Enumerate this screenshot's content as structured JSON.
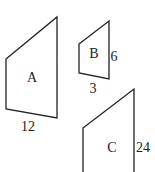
{
  "diagram": {
    "shapes": [
      {
        "id": "A",
        "label": "A",
        "dimension_label": "12",
        "dimension_side": "bottom",
        "points": "6,59 57,17 57,118 6,109",
        "label_pos": [
          32,
          82
        ],
        "dim_pos": [
          28,
          131
        ]
      },
      {
        "id": "B",
        "label": "B",
        "side_label": "6",
        "bottom_label": "3",
        "points": "79,44 109,21 109,79 79,73",
        "label_pos": [
          94,
          58
        ],
        "side_pos": [
          114,
          61
        ],
        "bottom_pos": [
          93,
          93
        ]
      },
      {
        "id": "C",
        "label": "C",
        "dimension_label": "24",
        "dimension_side": "right",
        "points": "83,173 83,128 134,89 134,173",
        "label_pos": [
          112,
          152
        ],
        "dim_pos": [
          143,
          152
        ]
      }
    ],
    "stroke_color": "#222222",
    "background": "#ffffff"
  }
}
